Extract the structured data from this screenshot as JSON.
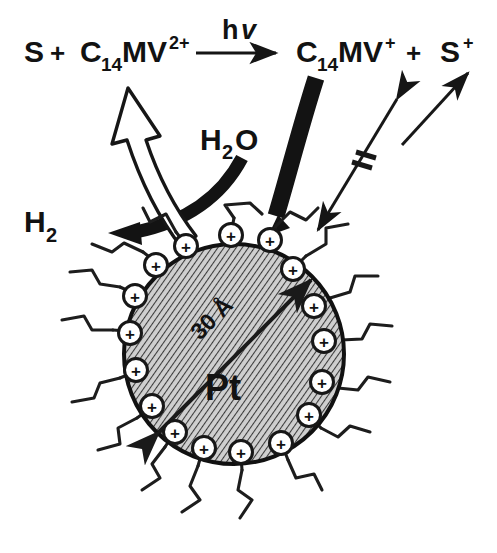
{
  "figure": {
    "background_color": "#ffffff",
    "ink_color": "#121212",
    "sphere_fill_color": "#c9c9c9",
    "hatch_color": "#2b2b2b"
  },
  "equation": {
    "reactant_sensitizer": "S",
    "plus_1": "+",
    "reactant_viologen_base": "C",
    "reactant_viologen_sub": "14",
    "reactant_viologen_mid": "MV",
    "reactant_viologen_sup": "2+",
    "light_label_base": "h",
    "light_label_italic": "v",
    "product_viologen_base": "C",
    "product_viologen_sub": "14",
    "product_viologen_mid": "MV",
    "product_viologen_sup": "+",
    "plus_2": "+",
    "product_sensitizer_base": "S",
    "product_sensitizer_sup": "+"
  },
  "labels": {
    "water": {
      "base": "H",
      "sub": "2",
      "tail": "O"
    },
    "hydrogen": {
      "base": "H",
      "sub": "2"
    },
    "particle_core": "Pt",
    "particle_diameter": "30 Å"
  },
  "arrows": {
    "photolysis_arrow": "straight-right-arrow",
    "electron_transfer_hollow_arrow": "hollow-curved-up-arrow",
    "water_to_hydrogen_arrow": "thick-black-curved-left-arrow",
    "viologen_to_particle_arrow": "thick-black-curved-down-arrow",
    "blocked_back_reaction_arrow": "double-headed-arrow-with-cross-bars",
    "diameter_arrow": "double-headed-diameter-arrow"
  },
  "surfactant": {
    "head_charge_glyph": "+",
    "head_count": 17,
    "head_description": "circled-positive-charge",
    "tail_description": "zigzag-alkyl-chain"
  },
  "particle": {
    "center_x": 234,
    "center_y": 354,
    "radius": 110
  }
}
